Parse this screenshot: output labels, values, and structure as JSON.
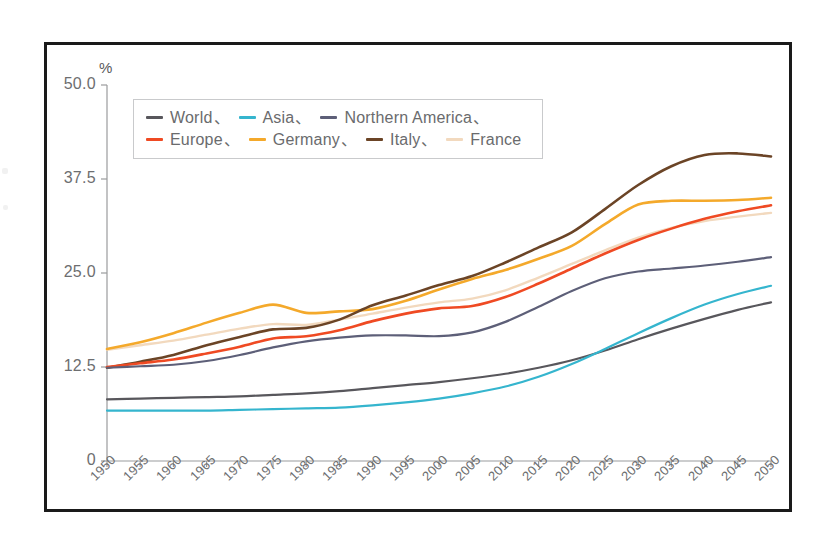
{
  "figure": {
    "unit_label": "%",
    "background": "#ffffff",
    "frame_color": "#1a1a1a"
  },
  "legend": {
    "separator": "、",
    "rows": [
      [
        {
          "label": "World",
          "color": "#58575c",
          "sep": true
        },
        {
          "label": "Asia",
          "color": "#35b5ce",
          "sep": true
        },
        {
          "label": "Northern America",
          "color": "#5d5f78",
          "sep": true
        }
      ],
      [
        {
          "label": "Europe",
          "color": "#ef4a23",
          "sep": true
        },
        {
          "label": "Germany",
          "color": "#f4a92b",
          "sep": true
        },
        {
          "label": "Italy",
          "color": "#6b4426",
          "sep": true
        },
        {
          "label": "France",
          "color": "#f2d9be",
          "sep": false
        }
      ]
    ]
  },
  "chart_data": {
    "type": "line",
    "title": "",
    "xlabel": "",
    "ylabel": "%",
    "ylim": [
      0,
      50
    ],
    "yticks": [
      0,
      12.5,
      25.0,
      37.5,
      50.0
    ],
    "ytick_labels": [
      "0",
      "12.5",
      "25.0",
      "37.5",
      "50.0"
    ],
    "grid": false,
    "legend_position": "top-left",
    "x": [
      1950,
      1955,
      1960,
      1965,
      1970,
      1975,
      1980,
      1985,
      1990,
      1995,
      2000,
      2005,
      2010,
      2015,
      2020,
      2025,
      2030,
      2035,
      2040,
      2045,
      2050
    ],
    "xtick_labels": [
      "1950",
      "1955",
      "1960",
      "1965",
      "1970",
      "1975",
      "1980",
      "1985",
      "1990",
      "1995",
      "2000",
      "2005",
      "2010",
      "2015",
      "2020",
      "2025",
      "2030",
      "2035",
      "2040",
      "2045",
      "2050"
    ],
    "series": [
      {
        "name": "World",
        "color": "#58575c",
        "width": 2.2,
        "values": [
          8.2,
          8.3,
          8.4,
          8.5,
          8.6,
          8.8,
          9.0,
          9.3,
          9.7,
          10.1,
          10.5,
          11.0,
          11.6,
          12.4,
          13.4,
          14.7,
          16.2,
          17.6,
          18.9,
          20.1,
          21.1
        ]
      },
      {
        "name": "Asia",
        "color": "#35b5ce",
        "width": 2.2,
        "values": [
          6.7,
          6.7,
          6.7,
          6.7,
          6.8,
          6.9,
          7.0,
          7.1,
          7.4,
          7.8,
          8.3,
          9.0,
          9.9,
          11.2,
          12.9,
          14.9,
          17.0,
          19.0,
          20.8,
          22.2,
          23.3
        ]
      },
      {
        "name": "Northern America",
        "color": "#5d5f78",
        "width": 2.2,
        "values": [
          12.4,
          12.6,
          12.8,
          13.3,
          14.1,
          15.1,
          15.9,
          16.4,
          16.7,
          16.7,
          16.6,
          17.1,
          18.5,
          20.5,
          22.6,
          24.3,
          25.2,
          25.6,
          26.0,
          26.5,
          27.1
        ]
      },
      {
        "name": "Europe",
        "color": "#ef4a23",
        "width": 2.6,
        "values": [
          12.5,
          13.0,
          13.5,
          14.3,
          15.2,
          16.3,
          16.6,
          17.4,
          18.6,
          19.6,
          20.3,
          20.6,
          21.8,
          23.6,
          25.6,
          27.6,
          29.4,
          30.9,
          32.2,
          33.2,
          34.0
        ]
      },
      {
        "name": "Germany",
        "color": "#f4a92b",
        "width": 2.6,
        "values": [
          14.9,
          15.8,
          17.0,
          18.4,
          19.7,
          20.8,
          19.7,
          19.9,
          20.2,
          21.3,
          22.8,
          24.2,
          25.4,
          26.9,
          28.6,
          31.5,
          34.1,
          34.6,
          34.6,
          34.7,
          35.0
        ]
      },
      {
        "name": "Italy",
        "color": "#6b4426",
        "width": 2.6,
        "values": [
          12.4,
          13.2,
          14.1,
          15.4,
          16.5,
          17.5,
          17.7,
          18.8,
          20.7,
          22.0,
          23.4,
          24.6,
          26.4,
          28.4,
          30.4,
          33.5,
          36.7,
          39.2,
          40.7,
          40.9,
          40.5
        ]
      },
      {
        "name": "France",
        "color": "#f2d9be",
        "width": 2.4,
        "values": [
          14.8,
          15.4,
          16.0,
          16.8,
          17.6,
          18.2,
          18.1,
          18.8,
          19.6,
          20.4,
          21.1,
          21.6,
          22.7,
          24.4,
          26.2,
          28.0,
          29.7,
          31.0,
          31.9,
          32.5,
          33.0
        ]
      }
    ]
  }
}
